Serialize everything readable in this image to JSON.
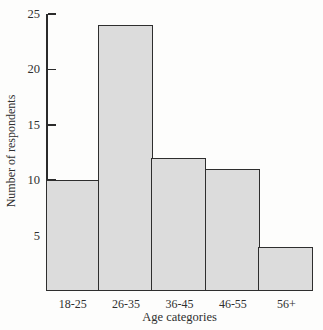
{
  "chart_data": {
    "type": "bar",
    "categories": [
      "18-25",
      "26-35",
      "36-45",
      "46-55",
      "56+"
    ],
    "values": [
      10,
      24,
      12,
      11,
      4
    ],
    "title": "",
    "xlabel": "Age categories",
    "ylabel": "Number of respondents",
    "ylim": [
      0,
      25
    ],
    "yticks": [
      5,
      10,
      15,
      20,
      25
    ],
    "grid": false,
    "legend": "none",
    "bar_fill_color": "#dcdcdc",
    "bar_border_color": "#2e2e2e",
    "axis_color": "#2b2b2b",
    "text_color": "#2f2f2f",
    "background_color": "#fdfdfc"
  }
}
